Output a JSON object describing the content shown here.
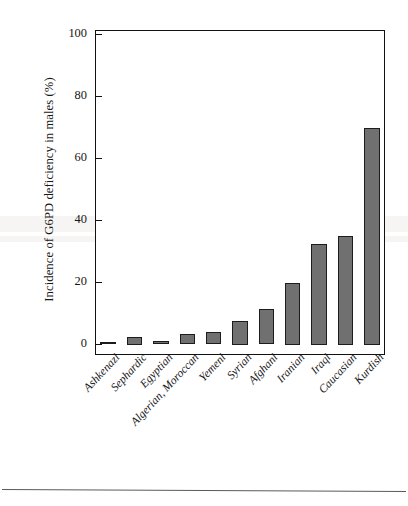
{
  "chart_data": {
    "type": "bar",
    "title": "",
    "xlabel": "",
    "ylabel": "Incidence of G6PD deficiency in males (%)",
    "ylim": [
      0,
      105
    ],
    "yticks": [
      0,
      20,
      40,
      60,
      80,
      100
    ],
    "ytick_labels": [
      "0",
      "20",
      "40",
      "60",
      "80",
      "100"
    ],
    "grid": false,
    "legend": false,
    "bar_color": "#707070",
    "bar_edge_color": "#1c1c1c",
    "axis_color": "#111111",
    "categories": [
      "Ashkenazi",
      "Sephardic",
      "Egyptian",
      "Algerian, Moroccan",
      "Yemeni",
      "Syrian",
      "Afghani",
      "Iranian",
      "Iraqi",
      "Caucasian",
      "Kurdish"
    ],
    "values": [
      0.5,
      2.5,
      1,
      3.5,
      4,
      7.5,
      11.5,
      20,
      32.5,
      35,
      70
    ]
  },
  "figure": {
    "separator_label": "figure-bottom-rule"
  }
}
